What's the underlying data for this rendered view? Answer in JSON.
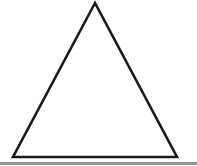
{
  "image": {
    "title": "Triangle outline",
    "description": "A black outlined isosceles triangle on a plain white background",
    "width": 197,
    "height": 166,
    "background_color": "#ffffff"
  },
  "shape": {
    "name": "triangle",
    "kind": "isosceles-triangle",
    "fill": "none",
    "fill_color": "#ffffff",
    "stroke_color": "#1a1a1a",
    "stroke_width": 2.6,
    "stroke_linejoin": "miter",
    "vertices": {
      "apex": {
        "x": 95,
        "y": 3
      },
      "bottom_left": {
        "x": 13,
        "y": 157
      },
      "bottom_right": {
        "x": 177,
        "y": 157
      }
    },
    "points": "95,3 13,157 177,157"
  },
  "edges": [
    {
      "name": "left-edge",
      "from": "apex",
      "to": "bottom_left"
    },
    {
      "name": "right-edge",
      "from": "apex",
      "to": "bottom_right"
    },
    {
      "name": "base-edge",
      "from": "bottom_left",
      "to": "bottom_right"
    }
  ],
  "artifacts": {
    "bottom_band": {
      "name": "bottom-edge-shadow-band",
      "color": "#3b3b3b",
      "opacity": 0.55,
      "y": 162,
      "height": 3
    }
  }
}
